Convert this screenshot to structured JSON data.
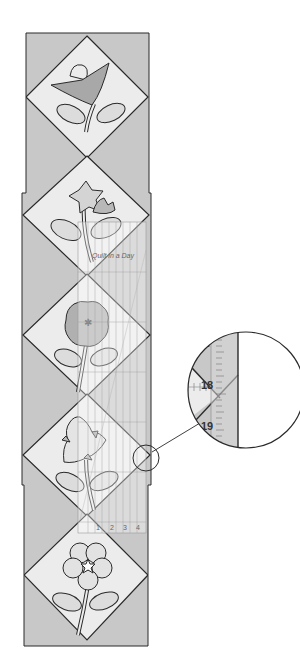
{
  "figure": {
    "type": "quilt-border-diagram",
    "colors": {
      "background": "#ffffff",
      "setting_triangle": "#c8c8c8",
      "block_background": "#ececec",
      "outline": "#2a2a2a",
      "petal_dark": "#a8a8a8",
      "petal_mid": "#bdbdbd",
      "leaf": "#dcdcdc",
      "ruler_tint": "#e4e4e4"
    },
    "blocks": [
      {
        "name": "tulip",
        "center_y": 97
      },
      {
        "name": "bellflower",
        "center_y": 215
      },
      {
        "name": "round-bloom",
        "center_y": 335
      },
      {
        "name": "trillium",
        "center_y": 455
      },
      {
        "name": "rose",
        "center_y": 575
      }
    ],
    "ruler": {
      "brand_text": "Quilt in a Day",
      "bottom_labels": [
        "1",
        "2",
        "3",
        "4",
        "5"
      ]
    },
    "magnifier": {
      "labels": [
        "17",
        "18",
        "19"
      ]
    }
  }
}
